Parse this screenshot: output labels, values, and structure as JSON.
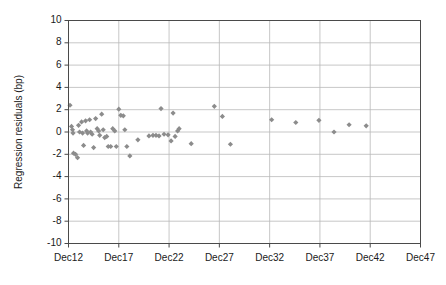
{
  "chart_data": {
    "type": "scatter",
    "title": "",
    "xlabel": "",
    "ylabel": "Regression residuals (bp)",
    "ylim": [
      -10,
      10
    ],
    "ytick_values": [
      10,
      8,
      6,
      4,
      2,
      0,
      -2,
      -4,
      -6,
      -8,
      -10
    ],
    "ytick_labels": [
      "10",
      "8",
      "6",
      "4",
      "2",
      "0",
      "-2",
      "-4",
      "-6",
      "-8",
      "-10"
    ],
    "xlim": [
      12,
      47
    ],
    "xtick_values": [
      12,
      17,
      22,
      27,
      32,
      37,
      42,
      47
    ],
    "xtick_labels": [
      "Dec12",
      "Dec17",
      "Dec22",
      "Dec27",
      "Dec32",
      "Dec37",
      "Dec42",
      "Dec47"
    ],
    "grid": "horizontal-and-vertical",
    "legend": "none",
    "marker_color": "#8c8c8c",
    "marker_shape": "diamond",
    "series": [
      {
        "name": "Regression residuals",
        "points": [
          [
            12.15,
            2.4
          ],
          [
            12.3,
            0.5
          ],
          [
            12.4,
            0.2
          ],
          [
            12.45,
            -0.1
          ],
          [
            12.5,
            -1.9
          ],
          [
            12.7,
            -2.0
          ],
          [
            12.9,
            -2.3
          ],
          [
            13.0,
            0.6
          ],
          [
            13.1,
            0.0
          ],
          [
            13.3,
            0.9
          ],
          [
            13.4,
            -0.1
          ],
          [
            13.5,
            -1.2
          ],
          [
            13.7,
            1.0
          ],
          [
            13.8,
            0.1
          ],
          [
            13.9,
            -0.1
          ],
          [
            14.1,
            1.1
          ],
          [
            14.2,
            0.0
          ],
          [
            14.35,
            -0.2
          ],
          [
            14.5,
            -1.4
          ],
          [
            14.7,
            1.2
          ],
          [
            14.85,
            0.3
          ],
          [
            15.0,
            0.1
          ],
          [
            15.1,
            -0.3
          ],
          [
            15.3,
            1.6
          ],
          [
            15.45,
            0.2
          ],
          [
            15.6,
            -0.5
          ],
          [
            15.8,
            -0.4
          ],
          [
            15.95,
            -1.3
          ],
          [
            16.2,
            -1.3
          ],
          [
            16.4,
            0.3
          ],
          [
            16.6,
            0.1
          ],
          [
            16.75,
            -1.3
          ],
          [
            17.0,
            2.05
          ],
          [
            17.2,
            1.5
          ],
          [
            17.45,
            1.45
          ],
          [
            17.6,
            0.2
          ],
          [
            17.8,
            -1.3
          ],
          [
            18.1,
            -2.15
          ],
          [
            18.9,
            -0.7
          ],
          [
            20.0,
            -0.35
          ],
          [
            20.4,
            -0.3
          ],
          [
            20.7,
            -0.3
          ],
          [
            21.0,
            -0.35
          ],
          [
            21.2,
            2.1
          ],
          [
            21.5,
            -0.2
          ],
          [
            21.9,
            -0.25
          ],
          [
            22.2,
            -0.8
          ],
          [
            22.4,
            1.7
          ],
          [
            22.6,
            -0.4
          ],
          [
            22.85,
            0.1
          ],
          [
            23.0,
            0.3
          ],
          [
            24.2,
            -1.05
          ],
          [
            26.5,
            2.3
          ],
          [
            27.3,
            1.4
          ],
          [
            28.1,
            -1.1
          ],
          [
            32.2,
            1.1
          ],
          [
            34.6,
            0.85
          ],
          [
            36.9,
            1.05
          ],
          [
            38.4,
            0.0
          ],
          [
            39.9,
            0.65
          ],
          [
            41.6,
            0.55
          ]
        ]
      }
    ]
  }
}
